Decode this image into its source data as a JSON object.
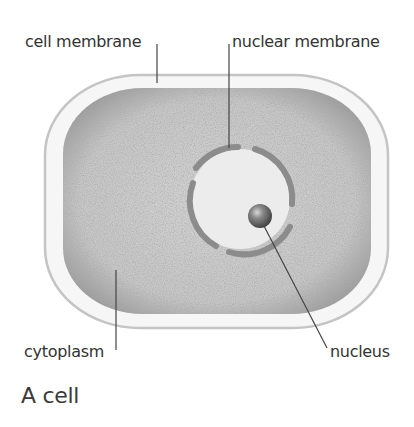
{
  "figure": {
    "caption": "A cell",
    "labels": {
      "cell_membrane": "cell membrane",
      "nuclear_membrane": "nuclear membrane",
      "cytoplasm": "cytoplasm",
      "nucleus": "nucleus"
    },
    "colors": {
      "cytoplasm_fill": "#c8c8c8",
      "cytoplasm_edge": "#8a8a8a",
      "membrane_fill": "#f4f4f4",
      "membrane_edge": "#c8c8c8",
      "nuclear_membrane": "#8c8c8c",
      "nucleoplasm": "#ececec",
      "leader_lines": "#444444",
      "text": "#333333"
    }
  }
}
